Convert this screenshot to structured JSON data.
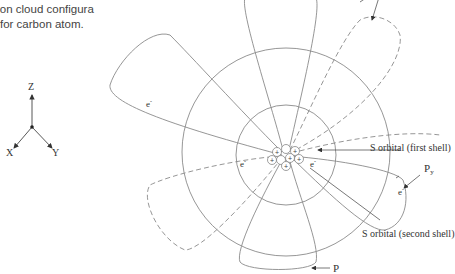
{
  "caption": {
    "line1": "ron cloud configura",
    "line2": "for carbon atom."
  },
  "axes": {
    "z": "Z",
    "x": "X",
    "y": "Y"
  },
  "labels": {
    "s_first_shell": "S orbital (first shell)",
    "s_second_shell": "S orbital (second shell)",
    "py_main": "P",
    "py_sub": "y",
    "pz_main": "P",
    "electron": "e",
    "electron_sup": "-"
  },
  "colors": {
    "line": "#8a8a8a",
    "text": "#333333"
  }
}
